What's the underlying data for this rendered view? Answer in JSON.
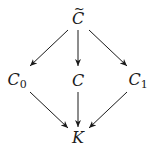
{
  "diagram": {
    "type": "commutative-diagram",
    "nodes": [
      {
        "id": "Ctilde",
        "label": "C",
        "decoration": "tilde",
        "x": 78,
        "y": 18
      },
      {
        "id": "C0",
        "label": "C",
        "subscript": "0",
        "x": 16,
        "y": 81
      },
      {
        "id": "C",
        "label": "C",
        "x": 78,
        "y": 81
      },
      {
        "id": "C1",
        "label": "C",
        "subscript": "1",
        "x": 138,
        "y": 81
      },
      {
        "id": "K",
        "label": "K",
        "x": 78,
        "y": 138
      }
    ],
    "edges": [
      {
        "from": "Ctilde",
        "to": "C0"
      },
      {
        "from": "Ctilde",
        "to": "C"
      },
      {
        "from": "Ctilde",
        "to": "C1"
      },
      {
        "from": "C0",
        "to": "K"
      },
      {
        "from": "C",
        "to": "K"
      },
      {
        "from": "C1",
        "to": "K"
      }
    ],
    "colors": {
      "stroke": "#1a1a1a",
      "background": "#ffffff"
    }
  }
}
